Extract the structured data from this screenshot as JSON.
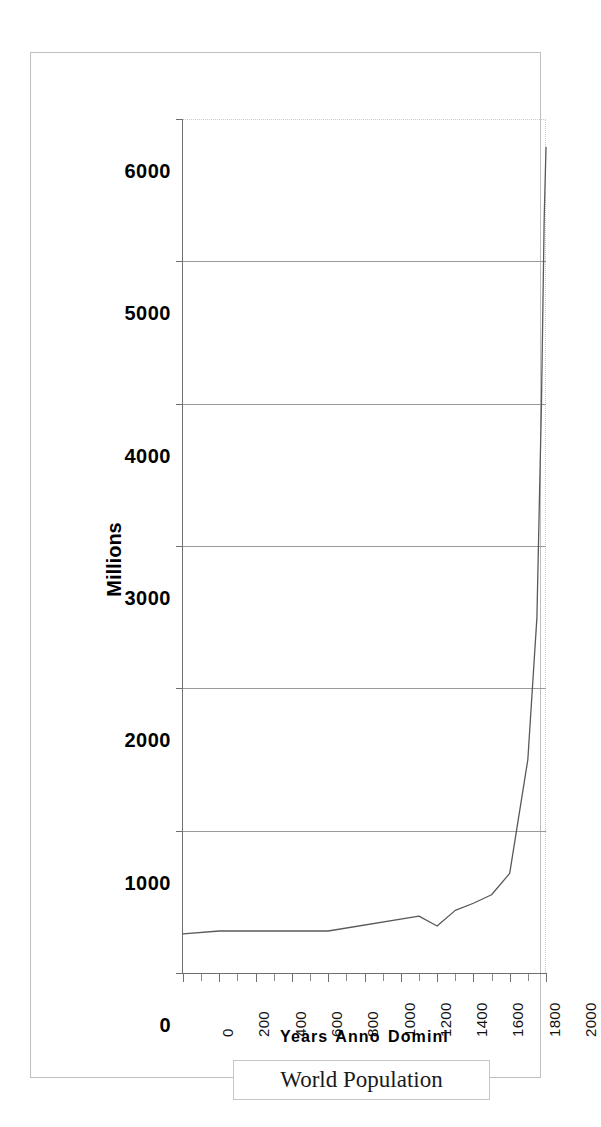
{
  "chart_data": {
    "type": "line",
    "title": "",
    "legend_label": "World Population",
    "legend_position": "bottom",
    "xlabel": "Years Anno Domini",
    "ylabel": "Millions",
    "xlim": [
      0,
      2000
    ],
    "ylim": [
      0,
      6000
    ],
    "grid": true,
    "x_ticks": [
      0,
      200,
      400,
      600,
      800,
      1000,
      1200,
      1400,
      1600,
      1800,
      2000
    ],
    "x_minor_tick_step": 100,
    "y_ticks": [
      0,
      1000,
      2000,
      3000,
      4000,
      5000,
      6000
    ],
    "x_tick_labels": [
      "0",
      "200",
      "400",
      "600",
      "800",
      "1000",
      "1200",
      "1400",
      "1600",
      "1800",
      "2000"
    ],
    "y_tick_labels": [
      "0",
      "1000",
      "2000",
      "3000",
      "4000",
      "5000",
      "6000"
    ],
    "series": [
      {
        "name": "World Population",
        "color": "#595959",
        "x": [
          0,
          200,
          800,
          1300,
          1400,
          1500,
          1600,
          1700,
          1800,
          1850,
          1900,
          1950,
          1975,
          1990,
          2000
        ],
        "values": [
          275,
          295,
          295,
          400,
          330,
          440,
          490,
          550,
          700,
          1100,
          1500,
          2500,
          4000,
          5300,
          5800
        ]
      }
    ]
  },
  "axis": {
    "y_title": "Millions",
    "x_title": "Years Anno Domini"
  },
  "legend": {
    "label": "World Population"
  }
}
